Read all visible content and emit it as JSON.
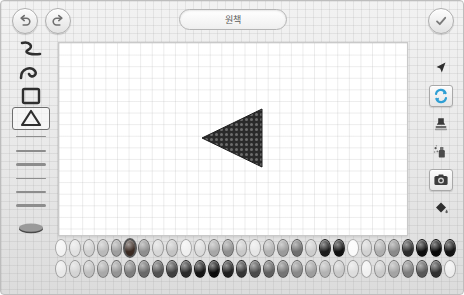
{
  "app": {
    "title": "원책",
    "canvas_background": "#ffffff",
    "chrome_background": "#ececec"
  },
  "topbar": {
    "undo_label": "undo-arrow",
    "redo_label": "redo-arrow",
    "confirm_label": "check",
    "title": "원책"
  },
  "left_tools": {
    "items": [
      {
        "name": "squiggle-line-tool",
        "icon": "squiggle",
        "selected": false
      },
      {
        "name": "curve-tool",
        "icon": "curve",
        "selected": false
      },
      {
        "name": "rectangle-tool",
        "icon": "rectangle",
        "selected": false
      },
      {
        "name": "triangle-tool",
        "icon": "triangle",
        "selected": true
      }
    ],
    "stroke_widths": [
      {
        "name": "stroke-width-1",
        "px": 1
      },
      {
        "name": "stroke-width-2",
        "px": 2
      },
      {
        "name": "stroke-width-3",
        "px": 3
      },
      {
        "name": "stroke-width-4",
        "px": 1
      },
      {
        "name": "stroke-width-5",
        "px": 2
      },
      {
        "name": "stroke-width-6",
        "px": 3
      }
    ],
    "brush_preview_label": "brush-stroke-preview"
  },
  "right_tools": {
    "items": [
      {
        "name": "cursor-tool",
        "icon": "arrow-cursor",
        "framed": false
      },
      {
        "name": "rotate-tool",
        "icon": "refresh-arrows",
        "framed": true,
        "accent": "#2f9fd4"
      },
      {
        "name": "stamp-tool",
        "icon": "stamp",
        "framed": false
      },
      {
        "name": "spray-tool",
        "icon": "spray-can",
        "framed": false
      },
      {
        "name": "camera-tool",
        "icon": "camera",
        "framed": true
      },
      {
        "name": "fill-tool",
        "icon": "paint-bucket",
        "framed": false
      }
    ]
  },
  "canvas": {
    "shape": {
      "name": "triangle-shape",
      "type": "triangle",
      "fill": "#2a2a2a",
      "pattern": "dotted",
      "x": 140,
      "y": 64,
      "width": 66,
      "height": 62
    }
  },
  "palette": {
    "rows": [
      {
        "name": "swatch-row-top",
        "colors": [
          "#f2f2f2",
          "#e2e2e2",
          "#cfcfcf",
          "#b9b9b9",
          "#9e9e9e",
          "#3a2a22",
          "#8e8e8e",
          "#d6d6d6",
          "#c3c3c3",
          "#efefef",
          "#dadada",
          "#a7a7a7",
          "#8f8f8f",
          "#c8c8c8",
          "#e6e6e6",
          "#b2b2b2",
          "#9a9a9a",
          "#6f6f6f",
          "#cccccc",
          "#1c1c1c",
          "#111111",
          "#fafafa",
          "#d2d2d2",
          "#aeaeae",
          "#8a8a8a",
          "#2b2b2b",
          "#0d0d0d",
          "#070707",
          "#111111"
        ],
        "active_index": 5
      },
      {
        "name": "swatch-row-bottom",
        "colors": [
          "#e8e8e8",
          "#d4d4d4",
          "#bfbfbf",
          "#a9a9a9",
          "#949494",
          "#7e7e7e",
          "#696969",
          "#545454",
          "#3f3f3f",
          "#2a2a2a",
          "#151515",
          "#0a0a0a",
          "#1f1f1f",
          "#343434",
          "#4a4a4a",
          "#5f5f5f",
          "#747474",
          "#898989",
          "#9e9e9e",
          "#b3b3b3",
          "#c8c8c8",
          "#dddddd",
          "#f0f0f0",
          "#cacaca",
          "#a4a4a4",
          "#7d7d7d",
          "#575757",
          "#303030",
          "#ededed"
        ],
        "active_index": -1
      }
    ]
  }
}
